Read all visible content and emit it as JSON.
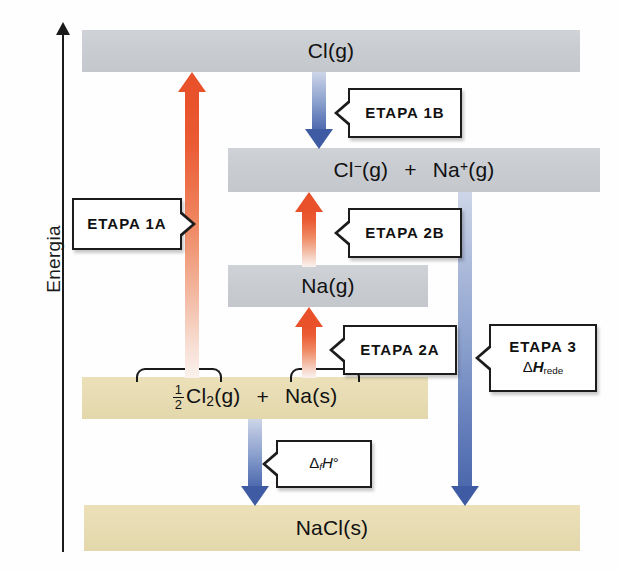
{
  "axis": {
    "label": "Energia",
    "direction": "up"
  },
  "levels": [
    {
      "id": "cl-g",
      "label": "Cl(g)",
      "style": "gray"
    },
    {
      "id": "cl-na-ion",
      "label": "Cl−(g) + Na+(g)",
      "style": "gray"
    },
    {
      "id": "na-g",
      "label": "Na(g)",
      "style": "gray"
    },
    {
      "id": "reactants",
      "label": "½Cl2(g) + Na(s)",
      "style": "tan"
    },
    {
      "id": "nacl-s",
      "label": "NaCl(s)",
      "style": "tan"
    }
  ],
  "reactants": {
    "cl2_coefficient_numerator": "1",
    "cl2_coefficient_denominator": "2",
    "cl2_formula": "Cl",
    "cl2_subscript": "2",
    "cl2_state": "(g)",
    "plus": "+",
    "na_formula": "Na",
    "na_state": "(s)"
  },
  "ions": {
    "cl_symbol": "Cl",
    "cl_charge": "−",
    "cl_state": "(g)",
    "plus": "+",
    "na_symbol": "Na",
    "na_charge": "+",
    "na_state": "(g)"
  },
  "arrows": [
    {
      "id": "etapa-1a",
      "direction": "up",
      "color": "#e8512a",
      "from": "reactants",
      "to": "cl-g"
    },
    {
      "id": "etapa-1b",
      "direction": "down",
      "color": "#3f5ba3",
      "from": "cl-g",
      "to": "cl-na-ion"
    },
    {
      "id": "etapa-2b",
      "direction": "up",
      "color": "#e8512a",
      "from": "na-g",
      "to": "cl-na-ion"
    },
    {
      "id": "etapa-2a",
      "direction": "up",
      "color": "#e8512a",
      "from": "reactants",
      "to": "na-g"
    },
    {
      "id": "etapa-3",
      "direction": "down",
      "color": "#3f5ba3",
      "from": "cl-na-ion",
      "to": "nacl-s"
    },
    {
      "id": "dfh",
      "direction": "down",
      "color": "#3f5ba3",
      "from": "reactants",
      "to": "nacl-s"
    }
  ],
  "callouts": {
    "etapa_1a": {
      "line1": "ETAPA 1A"
    },
    "etapa_1b": {
      "line1": "ETAPA 1B"
    },
    "etapa_2b": {
      "line1": "ETAPA 2B"
    },
    "etapa_2a": {
      "line1": "ETAPA 2A"
    },
    "etapa_3": {
      "line1": "ETAPA 3",
      "delta": "Δ",
      "h": "H",
      "subscript": "rede"
    },
    "dfh": {
      "delta": "Δ",
      "f": "f",
      "h": "H",
      "degree": "°"
    }
  },
  "colors": {
    "bar_gray": "#c9ccd1",
    "bar_tan": "#e7dcb3",
    "arrow_red": "#e8512a",
    "arrow_blue": "#3f5ba3",
    "axis": "#1a1a1a",
    "background": "#fefefe"
  }
}
